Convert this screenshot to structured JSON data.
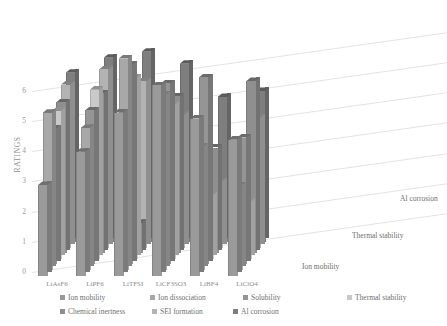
{
  "chart_data": {
    "type": "bar",
    "title": "",
    "subtitle": "",
    "xlabel": "",
    "ylabel": "RATINGS",
    "zlabel": "",
    "ylim": [
      0,
      6
    ],
    "yticks": [
      "0",
      "1",
      "2",
      "3",
      "4",
      "5",
      "6"
    ],
    "grid": true,
    "legend_position": "bottom",
    "projection": "3d-clustered-column",
    "categories": [
      "LiAsF6",
      "LiPF6",
      "LiTFSI",
      "LiCF3SO3",
      "LiBF4",
      "LiClO4"
    ],
    "depth_axis_labels": [
      "Ion mobility",
      "Thermal stability",
      "Al corrosion"
    ],
    "series": [
      {
        "name": "Ion mobility",
        "color": "#9a9a9a",
        "values": [
          3.0,
          4.1,
          5.4,
          6.3,
          5.2,
          4.5
        ]
      },
      {
        "name": "Ion dissociation",
        "color": "#a8a8a8",
        "values": [
          5.2,
          4.7,
          7.0,
          5.8,
          4.1,
          2.8
        ]
      },
      {
        "name": "Solubility",
        "color": "#959595",
        "values": [
          4.5,
          5.1,
          6.6,
          6.0,
          6.2,
          4.2
        ]
      },
      {
        "name": "Thermal stability",
        "color": "#c9c9c9",
        "values": [
          4.9,
          5.6,
          6.0,
          5.1,
          2.1,
          1.9
        ]
      },
      {
        "name": "Chemical inertness",
        "color": "#8f8f8f",
        "values": [
          5.0,
          5.3,
          1.0,
          5.2,
          3.5,
          5.7
        ]
      },
      {
        "name": "SEI formation",
        "color": "#b3b3b3",
        "values": [
          5.4,
          5.9,
          5.5,
          4.4,
          2.2,
          4.3
        ]
      },
      {
        "name": "Al corrosion",
        "color": "#7e7e7e",
        "values": [
          5.6,
          6.1,
          6.3,
          5.9,
          4.8,
          5.0
        ]
      }
    ]
  },
  "axis": {
    "y_title": "RATINGS",
    "ticks": [
      "6",
      "5",
      "4",
      "3",
      "2",
      "1",
      "0"
    ]
  },
  "legend": {
    "items": [
      {
        "label": "Ion mobility",
        "color": "#9a9a9a"
      },
      {
        "label": "Ion dissociation",
        "color": "#a8a8a8"
      },
      {
        "label": "Solubility",
        "color": "#959595"
      },
      {
        "label": "Thermal stability",
        "color": "#c9c9c9"
      },
      {
        "label": "Chemical inertness",
        "color": "#8f8f8f"
      },
      {
        "label": "SEI formation",
        "color": "#b3b3b3"
      },
      {
        "label": "Al corrosion",
        "color": "#7e7e7e"
      }
    ]
  },
  "depth_labels": {
    "near": "Ion mobility",
    "middle": "Thermal stability",
    "far": "Al corrosion"
  }
}
